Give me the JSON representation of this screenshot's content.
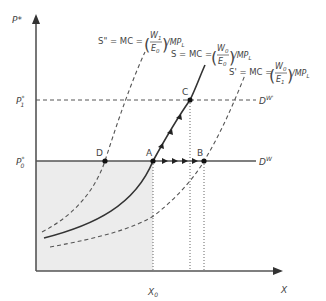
{
  "diagram": {
    "axes": {
      "y_label": "P*",
      "x_label": "X"
    },
    "price_levels": {
      "p0": {
        "label": "P",
        "sup": "*",
        "sub": "0"
      },
      "p1": {
        "label": "P",
        "sup": "*",
        "sub": "1"
      }
    },
    "demand_curves": {
      "dw": {
        "label": "D",
        "sup": "W"
      },
      "dw_prime": {
        "label": "D",
        "sup": "W'"
      }
    },
    "quantity_labels": {
      "x0": {
        "label": "X",
        "sub": "0"
      }
    },
    "points": {
      "A": "A",
      "B": "B",
      "C": "C",
      "D": "D"
    },
    "supply_curves": {
      "s_double_prime": {
        "lhs": "S\" = MC = ",
        "num": "W",
        "num_sub": "1",
        "den": "E",
        "den_sub": "0",
        "tail": "/MP",
        "tail_sub": "L"
      },
      "s": {
        "lhs": "S = MC = ",
        "num": "W",
        "num_sub": "0",
        "den": "E",
        "den_sub": "0",
        "tail": "/MP",
        "tail_sub": "L"
      },
      "s_prime": {
        "lhs": "S' = MC = ",
        "num": "W",
        "num_sub": "0",
        "den": "E",
        "den_sub": "1",
        "tail": "/MP",
        "tail_sub": "L"
      }
    },
    "colors": {
      "axis": "#555555",
      "curve": "#333333",
      "dashed": "#555555",
      "shade": "#ececec",
      "text": "#444444"
    }
  }
}
